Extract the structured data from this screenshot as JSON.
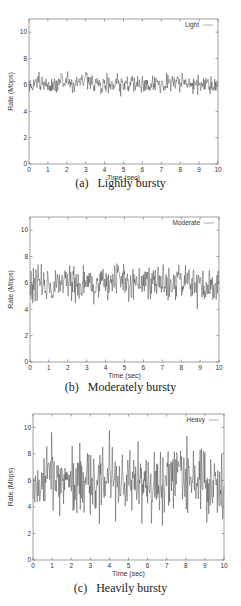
{
  "chart_data": [
    {
      "type": "line",
      "panel": "a",
      "caption_label": "(a)",
      "caption_text": "Lightly bursty",
      "title": "",
      "xlabel": "Time (sec)",
      "ylabel": "Rate (Mbps)",
      "xlim": [
        0,
        10
      ],
      "ylim": [
        0,
        11
      ],
      "xticks": [
        0,
        1,
        2,
        3,
        4,
        5,
        6,
        7,
        8,
        9,
        10
      ],
      "yticks": [
        0,
        2,
        4,
        6,
        8,
        10
      ],
      "grid": false,
      "legend": {
        "position": "top-right",
        "entries": [
          "Light"
        ]
      },
      "series": [
        {
          "name": "Light",
          "mean": 6.0,
          "min": 4.5,
          "max": 7.8,
          "samples": 400,
          "x": [
            0,
            0.5,
            1,
            1.5,
            2,
            2.5,
            3,
            3.5,
            4,
            4.5,
            5,
            5.5,
            6,
            6.5,
            7,
            7.5,
            8,
            8.5,
            9,
            9.5,
            10
          ],
          "values": [
            6.0,
            6.2,
            5.8,
            6.1,
            6.3,
            6.0,
            6.4,
            6.1,
            5.9,
            6.0,
            6.2,
            6.0,
            5.9,
            6.0,
            6.1,
            6.3,
            6.2,
            6.1,
            6.0,
            6.1,
            5.8
          ]
        }
      ],
      "seed": 11,
      "spread": 0.55,
      "frame": {
        "top": 19,
        "bottom": 164,
        "left": 29,
        "right": 218
      }
    },
    {
      "type": "line",
      "panel": "b",
      "caption_label": "(b)",
      "caption_text": "Moderately bursty",
      "title": "",
      "xlabel": "Time (sec)",
      "ylabel": "Rate (Mbps)",
      "xlim": [
        0,
        10
      ],
      "ylim": [
        0,
        11
      ],
      "xticks": [
        0,
        1,
        2,
        3,
        4,
        5,
        6,
        7,
        8,
        9,
        10
      ],
      "yticks": [
        0,
        2,
        4,
        6,
        8,
        10
      ],
      "grid": false,
      "legend": {
        "position": "top-right",
        "entries": [
          "Moderate"
        ]
      },
      "series": [
        {
          "name": "Moderate",
          "mean": 6.0,
          "min": 3.8,
          "max": 8.6,
          "samples": 400,
          "x": [
            0,
            0.5,
            1,
            1.5,
            2,
            2.5,
            3,
            3.5,
            4,
            4.5,
            5,
            5.5,
            6,
            6.5,
            7,
            7.5,
            8,
            8.5,
            9,
            9.5,
            10
          ],
          "values": [
            5.8,
            6.3,
            6.1,
            5.7,
            6.4,
            6.0,
            6.2,
            5.9,
            5.8,
            6.3,
            6.0,
            6.1,
            6.2,
            5.8,
            6.1,
            6.0,
            6.3,
            5.9,
            5.7,
            6.0,
            5.8
          ]
        }
      ],
      "seed": 23,
      "spread": 1.0,
      "frame": {
        "top": 217,
        "bottom": 362,
        "left": 30,
        "right": 219
      }
    },
    {
      "type": "line",
      "panel": "c",
      "caption_label": "(c)",
      "caption_text": "Heavily bursty",
      "title": "",
      "xlabel": "Time (sec)",
      "ylabel": "Rate (Mbps)",
      "xlim": [
        0,
        10
      ],
      "ylim": [
        0,
        11
      ],
      "xticks": [
        0,
        1,
        2,
        3,
        4,
        5,
        6,
        7,
        8,
        9,
        10
      ],
      "yticks": [
        0,
        2,
        4,
        6,
        8,
        10
      ],
      "grid": false,
      "legend": {
        "position": "top-right",
        "entries": [
          "Heavy"
        ]
      },
      "series": [
        {
          "name": "Heavy",
          "mean": 5.9,
          "min": 1.0,
          "max": 10.4,
          "samples": 400,
          "x": [
            0,
            0.5,
            1,
            1.5,
            2,
            2.5,
            3,
            3.5,
            4,
            4.5,
            5,
            5.5,
            6,
            6.5,
            7,
            7.5,
            8,
            8.5,
            9,
            9.5,
            10
          ],
          "values": [
            5.5,
            6.2,
            6.5,
            5.8,
            5.2,
            6.4,
            5.9,
            5.5,
            6.1,
            5.8,
            6.2,
            6.0,
            5.7,
            5.6,
            5.9,
            6.3,
            6.4,
            6.1,
            5.8,
            5.7,
            5.5
          ]
        }
      ],
      "seed": 37,
      "spread": 2.0,
      "frame": {
        "top": 414,
        "bottom": 560,
        "left": 33,
        "right": 224
      }
    }
  ]
}
